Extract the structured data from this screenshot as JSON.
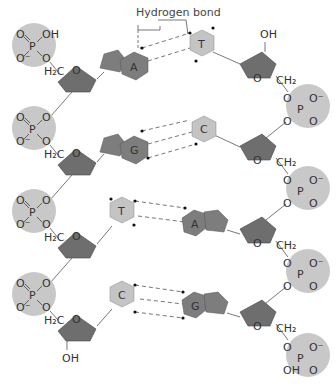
{
  "diagram": {
    "title_label": "Hydrogen bond",
    "colors": {
      "phosphate_fill": "#c8c8c8",
      "sugar_fill": "#6e6e6e",
      "purine_fill": "#7d7d7d",
      "pyrimidine_fill": "#c4c4c4",
      "bond_line": "#555555",
      "hbond_dash": "#666666"
    },
    "phosphate_atoms": {
      "P": "P",
      "O": "O",
      "O_minus": "O⁻",
      "OH": "OH"
    },
    "sugar_labels": {
      "ring_O": "O",
      "H2C": "H₂C",
      "CH2": "CH₂",
      "OH": "OH"
    },
    "base_pairs": [
      {
        "left": "A",
        "right": "T",
        "hbonds": 2
      },
      {
        "left": "G",
        "right": "C",
        "hbonds": 3
      },
      {
        "left": "T",
        "right": "A",
        "hbonds": 2
      },
      {
        "left": "C",
        "right": "G",
        "hbonds": 3
      }
    ],
    "left_strand": {
      "top_phosphate_groups": [
        "O",
        "OH",
        "O⁻",
        "O"
      ],
      "bottom_terminal": "OH"
    },
    "right_strand": {
      "top_terminal": "OH",
      "bottom_phosphate_groups": [
        "O",
        "O⁻",
        "OH",
        "O"
      ]
    }
  }
}
